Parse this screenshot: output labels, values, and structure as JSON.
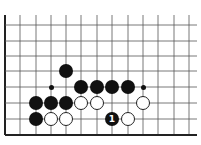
{
  "board": {
    "title": "Go problem diagram",
    "grid": {
      "columns_x": [
        5,
        20,
        36,
        51,
        66,
        81,
        97,
        112,
        128,
        143,
        158,
        174,
        189
      ],
      "rows_y": [
        25,
        41,
        56,
        71,
        87,
        103,
        119,
        135
      ],
      "top_y": 15,
      "right_x": 197,
      "left_edge_x": 5,
      "bottom_edge_y": 135,
      "line_color": "#555555",
      "edge_color": "#222222"
    },
    "stone_diameter": 14,
    "colors": {
      "black": "#111111",
      "white": "#ffffff",
      "outline": "#222222"
    },
    "stones": [
      {
        "color": "black",
        "col": 4,
        "row": 3,
        "label": ""
      },
      {
        "color": "black",
        "col": 5,
        "row": 4,
        "label": ""
      },
      {
        "color": "black",
        "col": 6,
        "row": 4,
        "label": ""
      },
      {
        "color": "black",
        "col": 7,
        "row": 4,
        "label": ""
      },
      {
        "color": "black",
        "col": 8,
        "row": 4,
        "label": ""
      },
      {
        "color": "black",
        "col": 2,
        "row": 5,
        "label": ""
      },
      {
        "color": "black",
        "col": 3,
        "row": 5,
        "label": ""
      },
      {
        "color": "black",
        "col": 4,
        "row": 5,
        "label": ""
      },
      {
        "color": "white",
        "col": 5,
        "row": 5,
        "label": ""
      },
      {
        "color": "white",
        "col": 6,
        "row": 5,
        "label": ""
      },
      {
        "color": "white",
        "col": 9,
        "row": 5,
        "label": ""
      },
      {
        "color": "black",
        "col": 2,
        "row": 6,
        "label": ""
      },
      {
        "color": "white",
        "col": 3,
        "row": 6,
        "label": ""
      },
      {
        "color": "white",
        "col": 4,
        "row": 6,
        "label": ""
      },
      {
        "color": "black",
        "col": 7,
        "row": 6,
        "label": "1"
      },
      {
        "color": "white",
        "col": 8,
        "row": 6,
        "label": ""
      }
    ],
    "markers": [
      {
        "type": "dot",
        "col": 3,
        "row": 4
      },
      {
        "type": "dot",
        "col": 9,
        "row": 4
      }
    ]
  }
}
